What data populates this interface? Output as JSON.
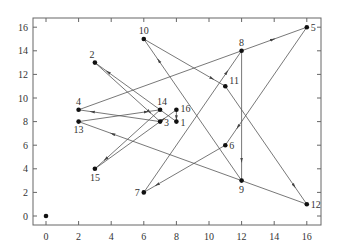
{
  "chart_data": {
    "type": "scatter",
    "title": "",
    "xlabel": "",
    "ylabel": "",
    "xlim": [
      -0.8,
      16.8
    ],
    "ylim": [
      -0.8,
      16.8
    ],
    "grid": false,
    "x_ticks": [
      0,
      2,
      4,
      6,
      8,
      10,
      12,
      14,
      16
    ],
    "y_ticks": [
      0,
      2,
      4,
      6,
      8,
      10,
      12,
      14,
      16
    ],
    "x_tick_labels": [
      "0",
      "2",
      "4",
      "6",
      "8",
      "10",
      "12",
      "14",
      "16"
    ],
    "y_tick_labels": [
      "0",
      "2",
      "4",
      "6",
      "8",
      "10",
      "12",
      "14",
      "16"
    ],
    "points": [
      {
        "id": "0",
        "label": "",
        "x": 0,
        "y": 0
      },
      {
        "id": "1",
        "label": "1",
        "x": 8,
        "y": 8
      },
      {
        "id": "2",
        "label": "2",
        "x": 3,
        "y": 13
      },
      {
        "id": "3",
        "label": "3",
        "x": 7,
        "y": 8
      },
      {
        "id": "4",
        "label": "4",
        "x": 2,
        "y": 9
      },
      {
        "id": "5",
        "label": "5",
        "x": 16,
        "y": 16
      },
      {
        "id": "6",
        "label": "6",
        "x": 11,
        "y": 6
      },
      {
        "id": "7",
        "label": "7",
        "x": 6,
        "y": 2
      },
      {
        "id": "8",
        "label": "8",
        "x": 12,
        "y": 14
      },
      {
        "id": "9",
        "label": "9",
        "x": 12,
        "y": 3
      },
      {
        "id": "10",
        "label": "10",
        "x": 6,
        "y": 15
      },
      {
        "id": "11",
        "label": "11",
        "x": 11,
        "y": 11
      },
      {
        "id": "12",
        "label": "12",
        "x": 16,
        "y": 1
      },
      {
        "id": "13",
        "label": "13",
        "x": 2,
        "y": 8
      },
      {
        "id": "14",
        "label": "14",
        "x": 7,
        "y": 9
      },
      {
        "id": "15",
        "label": "15",
        "x": 3,
        "y": 4
      },
      {
        "id": "16",
        "label": "16",
        "x": 8,
        "y": 9
      }
    ],
    "edges": [
      [
        "1",
        "2"
      ],
      [
        "2",
        "3"
      ],
      [
        "3",
        "4"
      ],
      [
        "4",
        "5"
      ],
      [
        "5",
        "6"
      ],
      [
        "6",
        "7"
      ],
      [
        "7",
        "8"
      ],
      [
        "8",
        "9"
      ],
      [
        "9",
        "10"
      ],
      [
        "10",
        "11"
      ],
      [
        "11",
        "12"
      ],
      [
        "12",
        "13"
      ],
      [
        "13",
        "14"
      ],
      [
        "14",
        "15"
      ],
      [
        "15",
        "16"
      ],
      [
        "16",
        "1"
      ]
    ],
    "edge_style": "directed-arrow",
    "colors": {
      "line": "#555555",
      "point": "#111111",
      "axis": "#666666"
    }
  }
}
